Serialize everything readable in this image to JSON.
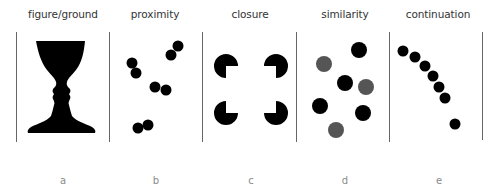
{
  "figure": {
    "panels": [
      {
        "id": "a",
        "title": "figure/ground",
        "letter": "a",
        "center_x": 63
      },
      {
        "id": "b",
        "title": "proximity",
        "letter": "b",
        "center_x": 155
      },
      {
        "id": "c",
        "title": "closure",
        "letter": "c",
        "center_x": 250
      },
      {
        "id": "d",
        "title": "similarity",
        "letter": "d",
        "center_x": 345
      },
      {
        "id": "e",
        "title": "continuation",
        "letter": "e",
        "center_x": 438
      }
    ],
    "divider_x": [
      16,
      109,
      202,
      296,
      389,
      482
    ],
    "divider_y": [
      32,
      142
    ],
    "colors": {
      "black": "#000000",
      "gray": "#555555",
      "divider": "#666666",
      "title": "#333333",
      "letter": "#8a8a8a"
    },
    "proximity_dots": [
      [
        178,
        46
      ],
      [
        171,
        55
      ],
      [
        132,
        63
      ],
      [
        136,
        73
      ],
      [
        155,
        87
      ],
      [
        166,
        90
      ],
      [
        138,
        128
      ],
      [
        148,
        125
      ]
    ],
    "closure_pacmen": [
      {
        "cx": 226,
        "cy": 66,
        "missing": "bottom-right"
      },
      {
        "cx": 276,
        "cy": 66,
        "missing": "bottom-left"
      },
      {
        "cx": 226,
        "cy": 113,
        "missing": "top-right"
      },
      {
        "cx": 276,
        "cy": 113,
        "missing": "top-left"
      }
    ],
    "similarity_dots": [
      {
        "cx": 359,
        "cy": 50,
        "fill": "black"
      },
      {
        "cx": 324,
        "cy": 64,
        "fill": "gray"
      },
      {
        "cx": 345,
        "cy": 83,
        "fill": "black"
      },
      {
        "cx": 366,
        "cy": 87,
        "fill": "gray"
      },
      {
        "cx": 320,
        "cy": 106,
        "fill": "black"
      },
      {
        "cx": 363,
        "cy": 113,
        "fill": "black"
      },
      {
        "cx": 336,
        "cy": 130,
        "fill": "gray"
      }
    ],
    "continuation_dots": [
      [
        403,
        51
      ],
      [
        415,
        57
      ],
      [
        425,
        66
      ],
      [
        433,
        76
      ],
      [
        439,
        87
      ],
      [
        445,
        98
      ],
      [
        455,
        124
      ]
    ]
  }
}
